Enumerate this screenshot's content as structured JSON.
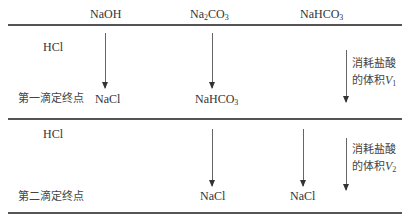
{
  "header": {
    "col_naoh": "NaOH",
    "col_na2co3": {
      "pre": "Na",
      "sub1": "2",
      "mid": "CO",
      "sub2": "3"
    },
    "col_nahco3": {
      "pre": "NaHCO",
      "sub": "3"
    }
  },
  "section1": {
    "reagent": "HCl",
    "endpoint_label": "第一滴定终点",
    "naoh_product": "NaCl",
    "na2co3_product": {
      "pre": "NaHCO",
      "sub": "3"
    },
    "volume_label_line1": "消耗盐酸",
    "volume_label_line2": "的体积",
    "volume_var": "V",
    "volume_sub": "1"
  },
  "section2": {
    "reagent": "HCl",
    "endpoint_label": "第二滴定终点",
    "na2co3_product": "NaCl",
    "nahco3_product": "NaCl",
    "volume_label_line1": "消耗盐酸",
    "volume_label_line2": "的体积",
    "volume_var": "V",
    "volume_sub": "2"
  }
}
